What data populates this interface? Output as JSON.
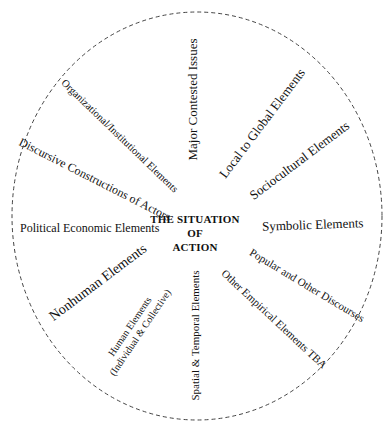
{
  "diagram": {
    "center_label": {
      "line1": "THE SITUATION",
      "line2": "OF",
      "line3": "ACTION"
    },
    "boundary": {
      "style": "dashed ellipse",
      "color": "#444444"
    },
    "elements": [
      {
        "id": "major-contested-issues",
        "label": "Major Contested Issues"
      },
      {
        "id": "local-to-global-elements",
        "label": "Local to Global Elements"
      },
      {
        "id": "sociocultural-elements",
        "label": "Sociocultural Elements"
      },
      {
        "id": "symbolic-elements",
        "label": "Symbolic Elements"
      },
      {
        "id": "popular-and-other-discourses",
        "label": "Popular and Other Discourses"
      },
      {
        "id": "other-empirical-elements",
        "label": "Other Empirical Elements TBA"
      },
      {
        "id": "spatial-temporal-elements",
        "label": "Spatial & Temporal Elements"
      },
      {
        "id": "human-elements",
        "label": "Human Elements",
        "sublabel": "(Individual & Collective)"
      },
      {
        "id": "nonhuman-elements",
        "label": "Nonhuman Elements"
      },
      {
        "id": "political-economic-elements",
        "label": "Political Economic Elements"
      },
      {
        "id": "discursive-constructions",
        "label": "Discursive Constructions of Actors"
      },
      {
        "id": "organizational-institutional",
        "label": "Organizational/Institutional Elements"
      }
    ]
  }
}
